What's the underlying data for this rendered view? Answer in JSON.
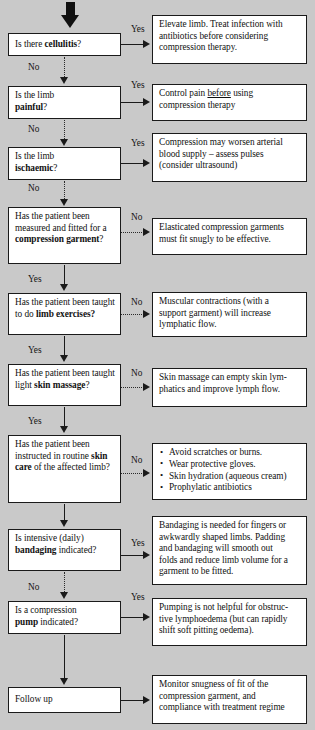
{
  "diagram": {
    "background_color": "#c9c9c9",
    "box_color": "#ffffff",
    "line_color": "#1a1a1a",
    "entry_arrow": "thick-down-arrow"
  },
  "labels": {
    "yes": "Yes",
    "no": "No"
  },
  "steps": [
    {
      "id": "cellulitis",
      "question_pre": "Is there ",
      "question_bold": "cellulitis",
      "question_post": "?",
      "branch_label": "Yes",
      "down_label": "No",
      "outcome_lines": [
        "Elevate limb. Treat infection with",
        "antibiotics before considering",
        "compression therapy."
      ]
    },
    {
      "id": "painful",
      "question_pre": "Is the limb",
      "question_bold": "painful",
      "question_post": "?",
      "branch_label": "Yes",
      "down_label": "No",
      "outcome_lines": [
        "Control pain before using",
        "compression therapy"
      ],
      "outcome_underline_word": "before"
    },
    {
      "id": "ischaemic",
      "question_pre": "Is the limb",
      "question_bold": "ischaemic",
      "question_post": "?",
      "branch_label": "Yes",
      "down_label": "No",
      "outcome_lines": [
        "Compression may worsen arterial",
        "blood supply – assess pulses",
        "(consider ultrasound)"
      ]
    },
    {
      "id": "compression-garment",
      "question_pre": "Has the patient been measured and fitted for a ",
      "question_bold": "compression garment",
      "question_post": "?",
      "branch_label": "No",
      "down_label": "Yes",
      "outcome_lines": [
        "Elasticated compression garments",
        "must fit snugly to be effective."
      ]
    },
    {
      "id": "limb-exercises",
      "question_pre": "Has the patient been taught to do ",
      "question_bold": "limb exercises?",
      "question_post": "",
      "branch_label": "No",
      "down_label": "Yes",
      "outcome_lines": [
        "Muscular contractions (with a",
        "support garment) will increase",
        "lymphatic flow."
      ]
    },
    {
      "id": "skin-massage",
      "question_pre": "Has the patient been taught light ",
      "question_bold": "skin massage",
      "question_post": "?",
      "branch_label": "No",
      "down_label": "Yes",
      "outcome_lines": [
        "Skin massage can empty skin lym-",
        "phatics and improve lymph flow."
      ]
    },
    {
      "id": "skin-care",
      "question_pre": "Has the patient been instructed in routine ",
      "question_bold": "skin care",
      "question_post": " of the affected limb?",
      "branch_label": "No",
      "down_label": "",
      "outcome_bullets": [
        "Avoid scratches or burns.",
        "Wear protective gloves.",
        "Skin hydration (aqueous cream)",
        "Prophylatic antibiotics"
      ]
    },
    {
      "id": "bandaging",
      "question_pre": "Is intensive (daily) ",
      "question_bold": "bandaging",
      "question_post": " indicated?",
      "branch_label": "Yes",
      "down_label": "No",
      "outcome_lines": [
        "Bandaging is needed for fingers or",
        "awkwardly shaped limbs. Padding",
        "and bandaging will smooth out",
        "folds and reduce limb volume for a",
        "garment to be fitted."
      ]
    },
    {
      "id": "compression-pump",
      "question_pre": "Is a compression ",
      "question_bold": "pump",
      "question_post": " indicated?",
      "branch_label": "Yes",
      "down_label": "",
      "outcome_lines": [
        "Pumping is not helpful for obstruc-",
        "tive lymphoedema (but can rapidly",
        "shift soft pitting oedema)."
      ]
    },
    {
      "id": "follow-up",
      "question_pre": "Follow up",
      "question_bold": "",
      "question_post": "",
      "branch_label": "",
      "down_label": "",
      "outcome_lines": [
        "Monitor snugness of fit of the",
        "compression garment, and",
        "compliance with treatment regime"
      ]
    }
  ]
}
